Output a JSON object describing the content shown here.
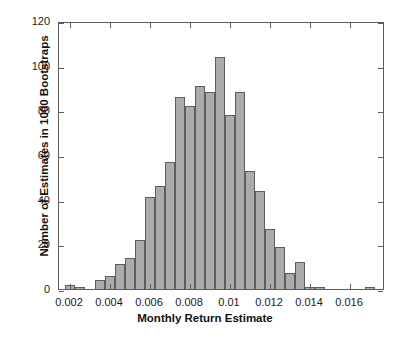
{
  "chart_data": {
    "type": "bar",
    "title": "",
    "subtitle": "",
    "xlabel": "Monthly Return Estimate",
    "ylabel": "Number of Estimates in 1000 Bootstraps",
    "xlim": [
      0.00145,
      0.01775
    ],
    "ylim": [
      0,
      120
    ],
    "xticks": [
      0.002,
      0.004,
      0.006,
      0.008,
      0.01,
      0.012,
      0.014,
      0.016
    ],
    "xtick_labels": [
      "0.002",
      "0.004",
      "0.006",
      "0.008",
      "0.01",
      "0.012",
      "0.014",
      "0.016"
    ],
    "yticks": [
      0,
      20,
      40,
      60,
      80,
      100,
      120
    ],
    "ytick_labels": [
      "0",
      "20",
      "40",
      "60",
      "80",
      "100",
      "120"
    ],
    "grid": false,
    "legend": null,
    "legend_position": "none",
    "bin_width": 0.0005,
    "bar_color": "#ababab",
    "bar_edge_color": "#5e5e5e",
    "axis_color": "#5b5b5b",
    "background_color": "#ffffff",
    "bin_left_edges": [
      0.00175,
      0.00225,
      0.00275,
      0.00325,
      0.00375,
      0.00425,
      0.00475,
      0.00525,
      0.00575,
      0.00625,
      0.00675,
      0.00725,
      0.00775,
      0.00825,
      0.00875,
      0.00925,
      0.00975,
      0.01025,
      0.01075,
      0.01125,
      0.01175,
      0.01225,
      0.01275,
      0.01325,
      0.01375,
      0.01425,
      0.01475,
      0.01675
    ],
    "categories": [
      "0.00175-0.00225",
      "0.00225-0.00275",
      "0.00275-0.00325",
      "0.00325-0.00375",
      "0.00375-0.00425",
      "0.00425-0.00475",
      "0.00475-0.00525",
      "0.00525-0.00575",
      "0.00575-0.00625",
      "0.00625-0.00675",
      "0.00675-0.00725",
      "0.00725-0.00775",
      "0.00775-0.00825",
      "0.00825-0.00875",
      "0.00875-0.00925",
      "0.00925-0.00975",
      "0.00975-0.01025",
      "0.01025-0.01075",
      "0.01075-0.01125",
      "0.01125-0.01175",
      "0.01175-0.01225",
      "0.01225-0.01275",
      "0.01275-0.01325",
      "0.01325-0.01375",
      "0.01375-0.01425",
      "0.01425-0.01475",
      "0.01475-0.01525",
      "0.01675-0.01725"
    ],
    "values": [
      2,
      1,
      0,
      4,
      6,
      11,
      14,
      22,
      41,
      46,
      57,
      86,
      82,
      91,
      88,
      104,
      78,
      88,
      53,
      44,
      27,
      19,
      7,
      12,
      1,
      1,
      0,
      1
    ]
  }
}
